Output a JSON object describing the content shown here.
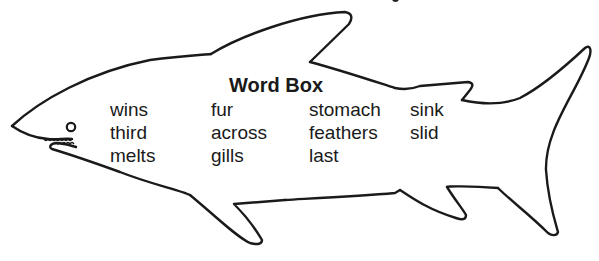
{
  "word_box": {
    "title": "Word Box",
    "columns": [
      [
        "wins",
        "third",
        "melts"
      ],
      [
        "fur",
        "across",
        "gills"
      ],
      [
        "stomach",
        "feathers",
        "last"
      ],
      [
        "sink",
        "slid"
      ]
    ]
  },
  "figure": {
    "shape": "shark-outline",
    "stroke_color": "#1a1a1a",
    "background_color": "#ffffff"
  }
}
